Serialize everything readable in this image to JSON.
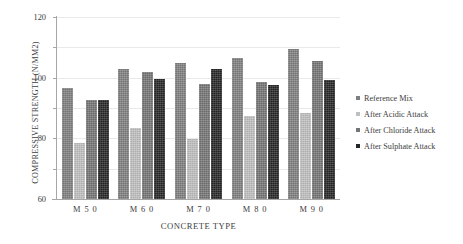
{
  "chart_data": {
    "type": "bar",
    "title": "",
    "xlabel": "CONCRETE TYPE",
    "ylabel": "COMPRESSIVE STRENGTH (N/MM2)",
    "categories": [
      "M 5 0",
      "M 6 0",
      "M 7 0",
      "M 8 0",
      "M 9 0"
    ],
    "series": [
      {
        "name": "Reference Mix",
        "color": "#7f7f7f",
        "values": [
          73,
          86,
          90,
          93,
          99
        ]
      },
      {
        "name": "After Acidic Attack",
        "color": "#bfbfbf",
        "values": [
          37,
          47,
          39.5,
          55,
          57
        ]
      },
      {
        "name": "After Chloride Attack",
        "color": "#757575",
        "values": [
          65,
          84,
          76,
          77,
          91
        ]
      },
      {
        "name": "After Sulphate Attack",
        "color": "#262626",
        "values": [
          65,
          79,
          85.5,
          75,
          78.5
        ]
      }
    ],
    "ylim": [
      0,
      120
    ],
    "yticks": [
      0,
      20,
      40,
      60,
      80,
      100,
      120
    ],
    "ytick_labels": [
      "0",
      "20",
      "40",
      "60",
      "80",
      "100",
      "120"
    ],
    "grid": true,
    "grid_axis": "y",
    "legend_position": "right"
  }
}
